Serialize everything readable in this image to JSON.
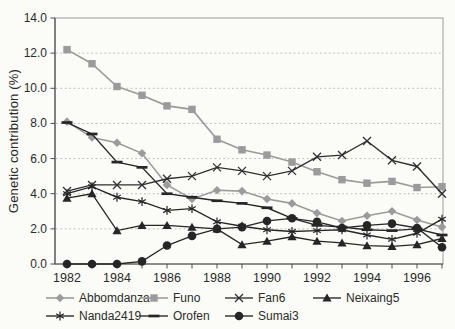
{
  "chart_data": {
    "type": "line",
    "title": "",
    "xlabel": "",
    "ylabel": "Genetic contribution (%)",
    "ylim": [
      0,
      14
    ],
    "x_years": [
      1982,
      1983,
      1984,
      1985,
      1986,
      1987,
      1988,
      1989,
      1990,
      1991,
      1992,
      1993,
      1994,
      1995,
      1996,
      1997
    ],
    "x_tick_years": [
      1982,
      1984,
      1986,
      1988,
      1990,
      1992,
      1994,
      1996
    ],
    "x_tick_labels": [
      "1982",
      "1984",
      "1986",
      "1988",
      "1990",
      "1992",
      "1994",
      "1996"
    ],
    "y_ticks": [
      0,
      2,
      4,
      6,
      8,
      10,
      12,
      14
    ],
    "y_tick_labels": [
      "0.0",
      "2.0",
      "4.0",
      "6.0",
      "8.0",
      "10.0",
      "12.0",
      "14.0"
    ],
    "gridline_values": [
      2,
      4,
      6,
      8,
      10,
      12
    ],
    "grid": "horizontal-dashed",
    "legend_position": "bottom",
    "axis_color": "#4f4f4f",
    "grid_color": "#b5b5b5",
    "border_color": "#9c9c9c",
    "series": [
      {
        "name": "Abbomdanza",
        "marker": "diamond",
        "color": "#9b9b9b",
        "values": [
          8.1,
          7.2,
          6.9,
          6.3,
          4.5,
          3.7,
          4.2,
          4.15,
          3.7,
          3.45,
          2.9,
          2.45,
          2.75,
          3.0,
          2.5,
          2.1
        ]
      },
      {
        "name": "Funo",
        "marker": "square",
        "color": "#9b9b9b",
        "values": [
          12.2,
          11.4,
          10.1,
          9.6,
          9.0,
          8.8,
          7.1,
          6.5,
          6.2,
          5.8,
          5.25,
          4.8,
          4.6,
          4.7,
          4.35,
          4.4
        ]
      },
      {
        "name": "Fan6",
        "marker": "x",
        "color": "#2f2f2f",
        "values": [
          4.15,
          4.5,
          4.5,
          4.5,
          4.85,
          5.0,
          5.5,
          5.3,
          5.0,
          5.3,
          6.1,
          6.2,
          7.0,
          5.9,
          5.55,
          4.0
        ]
      },
      {
        "name": "Neixaing5",
        "marker": "triangle",
        "color": "#262626",
        "values": [
          3.75,
          4.0,
          1.9,
          2.2,
          2.2,
          2.1,
          2.0,
          1.1,
          1.3,
          1.55,
          1.3,
          1.2,
          1.05,
          1.0,
          1.1,
          1.45
        ]
      },
      {
        "name": "Nanda2419",
        "marker": "asterisk",
        "color": "#262626",
        "values": [
          4.0,
          4.4,
          3.8,
          3.55,
          3.05,
          3.15,
          2.4,
          2.15,
          1.95,
          1.85,
          1.9,
          1.95,
          1.65,
          1.4,
          1.75,
          2.55
        ]
      },
      {
        "name": "Orofen",
        "marker": "dash",
        "color": "#262626",
        "values": [
          8.05,
          7.4,
          5.8,
          5.5,
          4.0,
          3.8,
          3.6,
          3.45,
          3.2,
          2.6,
          2.2,
          2.1,
          1.95,
          1.9,
          2.0,
          1.65
        ]
      },
      {
        "name": "Sumai3",
        "marker": "circle",
        "color": "#262626",
        "values": [
          0.0,
          0.0,
          0.0,
          0.15,
          1.05,
          1.6,
          2.0,
          2.1,
          2.45,
          2.6,
          2.4,
          2.05,
          2.2,
          2.3,
          2.05,
          0.95
        ]
      }
    ],
    "legend_rows": [
      [
        "Abbomdanza",
        "Funo",
        "Fan6",
        "Neixaing5"
      ],
      [
        "Nanda2419",
        "Orofen",
        "Sumai3"
      ]
    ]
  }
}
